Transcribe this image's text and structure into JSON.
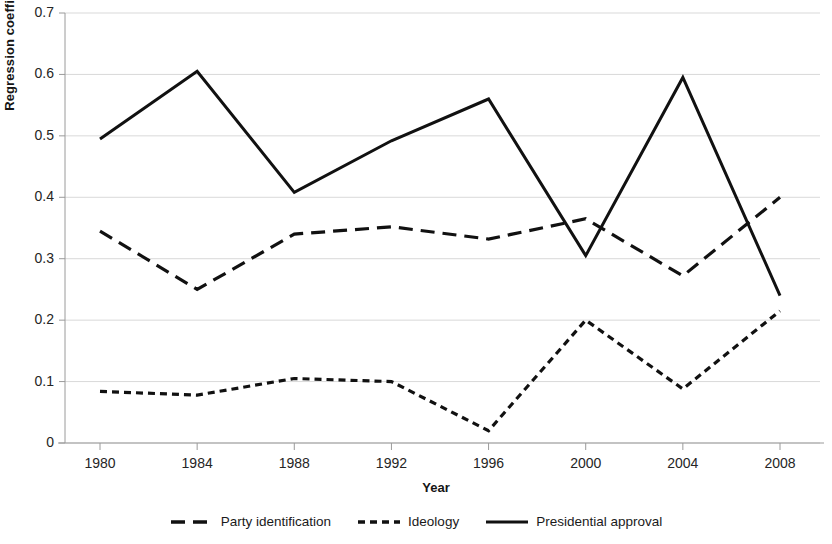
{
  "chart_data": {
    "type": "line",
    "title": "",
    "xlabel": "Year",
    "ylabel": "Regression coefficient",
    "x": [
      1980,
      1984,
      1988,
      1992,
      1996,
      2000,
      2004,
      2008
    ],
    "categories": [
      "1980",
      "1984",
      "1988",
      "1992",
      "1996",
      "2000",
      "2004",
      "2008"
    ],
    "xlim": [
      1980,
      2008
    ],
    "ylim": [
      0,
      0.7
    ],
    "yticks": [
      0,
      0.1,
      0.2,
      0.3,
      0.4,
      0.5,
      0.6,
      0.7
    ],
    "ytick_labels": [
      "0",
      "0.1",
      "0.2",
      "0.3",
      "0.4",
      "0.5",
      "0.6",
      "0.7"
    ],
    "grid": true,
    "legend_position": "bottom",
    "series": [
      {
        "name": "Party identification",
        "style": "long-dashed",
        "color": "#111111",
        "values": [
          0.345,
          0.25,
          0.34,
          0.352,
          0.332,
          0.365,
          0.272,
          0.4
        ]
      },
      {
        "name": "Ideology",
        "style": "short-dashed",
        "color": "#111111",
        "values": [
          0.084,
          0.078,
          0.105,
          0.1,
          0.02,
          0.2,
          0.088,
          0.215
        ]
      },
      {
        "name": "Presidential approval",
        "style": "solid",
        "color": "#111111",
        "values": [
          0.495,
          0.605,
          0.408,
          0.492,
          0.56,
          0.305,
          0.595,
          0.24
        ]
      }
    ]
  },
  "axis": {
    "ylabel": "Regression coefficient",
    "xlabel": "Year"
  },
  "legend": {
    "items": [
      {
        "label": "Party identification"
      },
      {
        "label": "Ideology"
      },
      {
        "label": "Presidential approval"
      }
    ]
  }
}
